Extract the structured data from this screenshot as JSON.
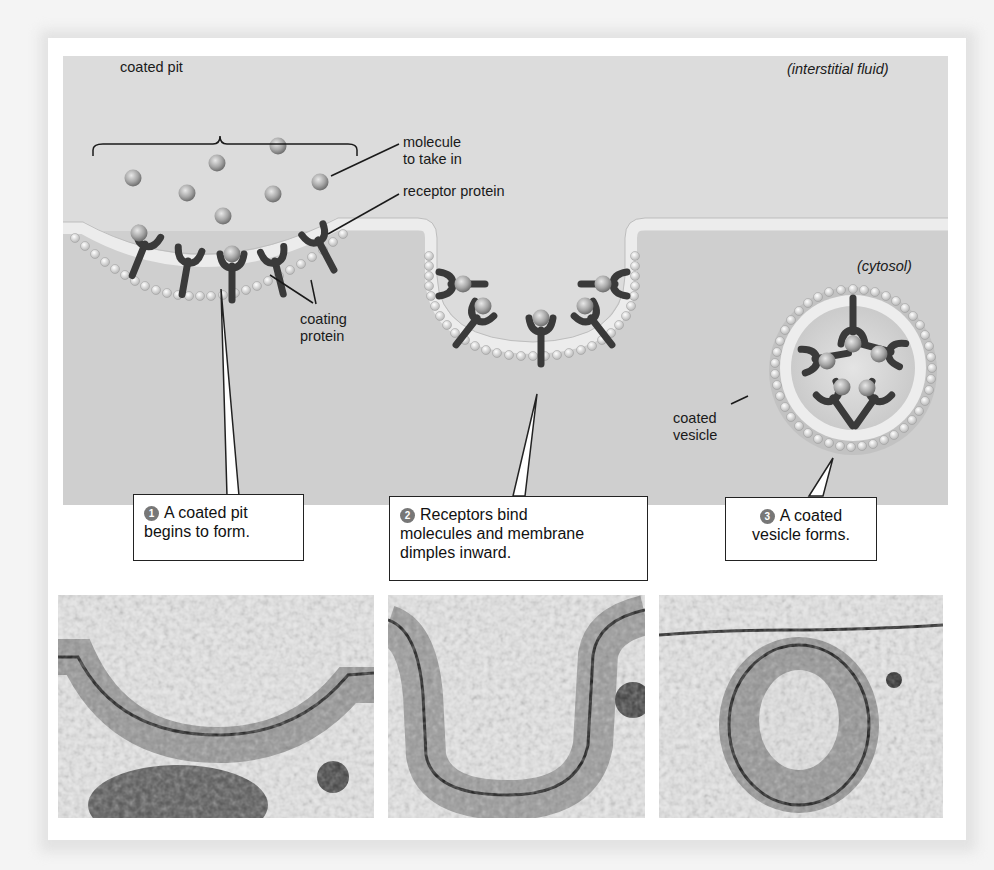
{
  "labels": {
    "coated_pit": "coated pit",
    "interstitial_fluid": "(interstitial fluid)",
    "cytosol": "(cytosol)",
    "molecule_line1": "molecule",
    "molecule_line2": "to take in",
    "receptor_protein": "receptor protein",
    "coating_line1": "coating",
    "coating_line2": "protein",
    "coated_vesicle_line1": "coated",
    "coated_vesicle_line2": "vesicle"
  },
  "steps": [
    {
      "number": "1",
      "line1": "A coated pit",
      "line2": "begins to form.",
      "line3": ""
    },
    {
      "number": "2",
      "line1": "Receptors bind",
      "line2": "molecules and membrane",
      "line3": "dimples inward."
    },
    {
      "number": "3",
      "line1": "A coated",
      "line2": "vesicle forms.",
      "line3": ""
    }
  ],
  "micrographs": [
    {
      "stage": "coated pit"
    },
    {
      "stage": "dimpling membrane"
    },
    {
      "stage": "coated vesicle"
    }
  ],
  "colors": {
    "background": "#dcdcdc",
    "cytosol": "#cfcfcf",
    "receptor": "#3a3a3a",
    "molecule": "#a8a8a8",
    "badge": "#777777"
  }
}
